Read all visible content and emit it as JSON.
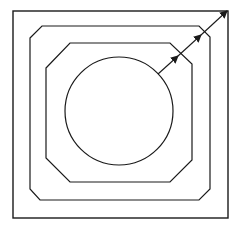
{
  "diagram": {
    "stroke_color": "#1a1a1a",
    "background": "#ffffff",
    "shapes": {
      "outer_square": {
        "x": 13,
        "y": 11,
        "w": 215,
        "h": 207
      },
      "middle_octagon": "30,38 42,26 199,26 210,37 210,189 199,200 40,200 30,189",
      "inner_octagon": "46,68 70,43 170,43 192,64 192,160 170,182 70,182 46,158",
      "circle": {
        "cx": 119,
        "cy": 111,
        "r": 54
      }
    },
    "arrows": [
      {
        "from": [
          158,
          74
        ],
        "to": [
          178,
          56
        ]
      },
      {
        "from": [
          178,
          56
        ],
        "to": [
          201,
          35
        ]
      },
      {
        "from": [
          201,
          35
        ],
        "to": [
          227,
          11
        ]
      }
    ]
  }
}
